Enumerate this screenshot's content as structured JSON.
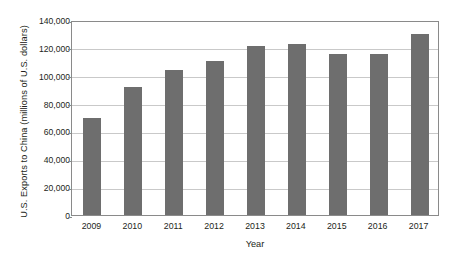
{
  "chart_data": {
    "type": "bar",
    "title": "",
    "xlabel": "Year",
    "ylabel": "U.S. Exports to China (millions of U.S. dollars)",
    "categories": [
      "2009",
      "2010",
      "2011",
      "2012",
      "2013",
      "2014",
      "2015",
      "2016",
      "2017"
    ],
    "values": [
      70000,
      92000,
      104000,
      110500,
      121500,
      123000,
      115500,
      115500,
      130000
    ],
    "ylim": [
      0,
      140000
    ],
    "ytick_values": [
      0,
      20000,
      40000,
      60000,
      80000,
      100000,
      120000,
      140000
    ],
    "ytick_labels": [
      "0",
      "20,000",
      "40,000",
      "60,000",
      "80,000",
      "100,000",
      "120,000",
      "140,000"
    ],
    "grid": true,
    "grid_axis": "y",
    "legend": false,
    "legend_position": "none",
    "series": [
      {
        "name": "U.S. Exports to China",
        "values": [
          70000,
          92000,
          104000,
          110500,
          121500,
          123000,
          115500,
          115500,
          130000
        ]
      }
    ]
  },
  "colors": {
    "bar_fill": "#6e6e6e",
    "gridline": "#c9c9c9",
    "axis_border": "#8a8a8a",
    "text": "#231f20",
    "background": "#ffffff"
  }
}
